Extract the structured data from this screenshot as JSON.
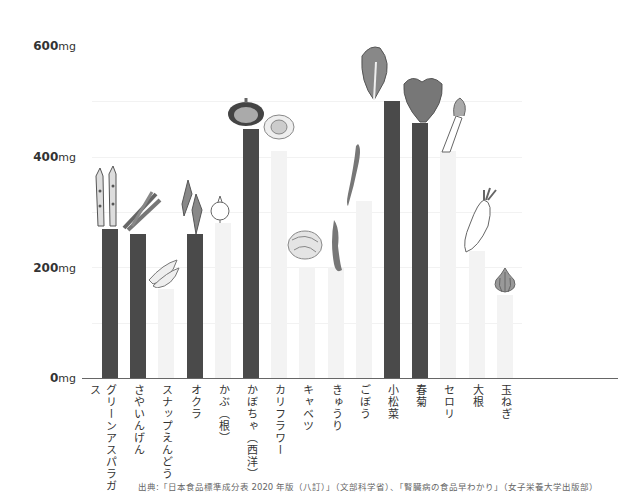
{
  "chart_data": {
    "type": "bar",
    "title": "",
    "xlabel": "",
    "ylabel": "",
    "ylim": [
      0,
      600
    ],
    "y_ticks": [
      {
        "value": 0,
        "num": "0",
        "unit": "mg"
      },
      {
        "value": 200,
        "num": "200",
        "unit": "mg"
      },
      {
        "value": 400,
        "num": "400",
        "unit": "mg"
      },
      {
        "value": 600,
        "num": "600",
        "unit": "mg"
      }
    ],
    "grid": "faint horizontal at 100mg intervals",
    "categories": [
      "グリーンアスパラガス",
      "さやいんげん",
      "スナップえんどう",
      "オクラ",
      "かぶ（根）",
      "かぼちゃ（西洋）",
      "カリフラワー",
      "キャベツ",
      "きゅうり",
      "ごぼう",
      "小松菜",
      "春菊",
      "セロリ",
      "大根",
      "玉ねぎ"
    ],
    "values": [
      270,
      260,
      160,
      260,
      280,
      450,
      410,
      200,
      200,
      320,
      500,
      460,
      410,
      230,
      150
    ],
    "highlight": [
      true,
      true,
      false,
      true,
      false,
      true,
      false,
      false,
      false,
      false,
      true,
      true,
      false,
      false,
      false
    ],
    "colors": {
      "highlight": "#4a4a4a",
      "normal": "#f3f3f3",
      "axis": "#666666"
    }
  },
  "source_note": "出典:「日本食品標準成分表 2020 年版（八訂）」（文部科学省）、「腎臓病の食品早わかり」（女子栄養大学出版部）"
}
